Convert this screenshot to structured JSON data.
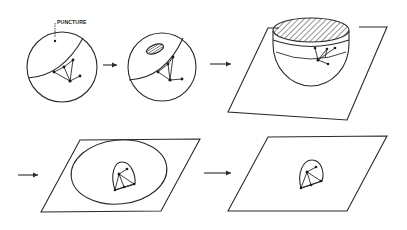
{
  "diagram": {
    "title": "",
    "colors": {
      "ink": "#2a2a2a",
      "background": "#ffffff"
    },
    "labels": {
      "puncture": "PUNCTURE"
    },
    "stages": [
      {
        "id": 1,
        "name": "sphere-with-puncture",
        "shape": "circle",
        "has_puncture_point": true,
        "graph_nodes": 5
      },
      {
        "id": 2,
        "name": "sphere-with-hole",
        "shape": "circle",
        "has_hatched_hole": true,
        "graph_nodes": 5
      },
      {
        "id": 3,
        "name": "hemisphere-on-plane",
        "shape": "bowl-on-parallelogram",
        "has_hatched_opening": true,
        "graph_nodes": 5
      },
      {
        "id": 4,
        "name": "stretched-disc-on-plane",
        "shape": "ellipse-on-parallelogram",
        "graph_nodes": 5
      },
      {
        "id": 5,
        "name": "planar-graph",
        "shape": "parallelogram",
        "graph_nodes": 5
      }
    ],
    "arrows": [
      {
        "from": 1,
        "to": 2,
        "icon": "right-arrow-icon"
      },
      {
        "from": 2,
        "to": 3,
        "icon": "right-arrow-icon"
      },
      {
        "from": 3,
        "to": 4,
        "icon": "right-arrow-icon"
      },
      {
        "from": 4,
        "to": 5,
        "icon": "right-arrow-icon"
      }
    ]
  }
}
